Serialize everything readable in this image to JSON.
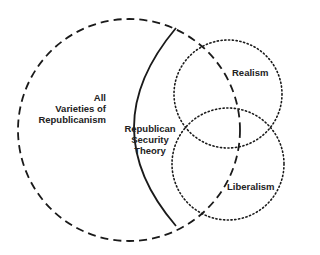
{
  "diagram": {
    "sets": [
      {
        "id": "all-republicanism",
        "label_lines": [
          "All",
          "Varieties of",
          "Republicanism"
        ],
        "style": "dashed"
      },
      {
        "id": "republican-security-theory",
        "label_lines": [
          "Republican",
          "Security",
          "Theory"
        ],
        "style": "solid"
      },
      {
        "id": "realism",
        "label_lines": [
          "Realism"
        ],
        "style": "dotted"
      },
      {
        "id": "liberalism",
        "label_lines": [
          "Liberalism"
        ],
        "style": "dotted"
      }
    ],
    "colors": {
      "stroke": "#1a1a1a",
      "background": "#ffffff"
    }
  }
}
